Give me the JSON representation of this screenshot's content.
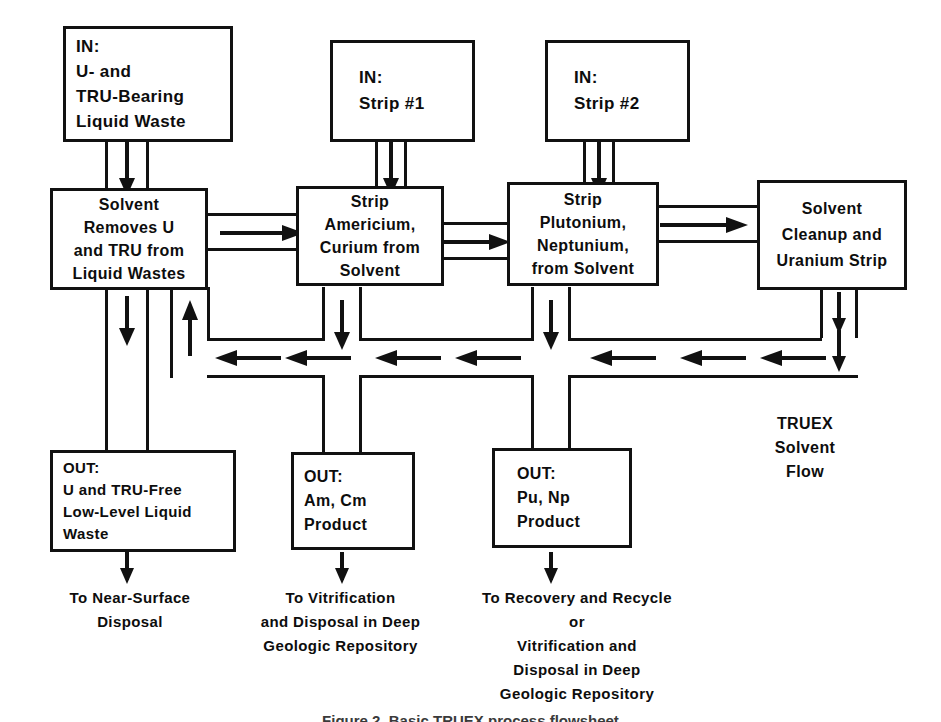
{
  "diagram": {
    "title": "TRUEX Process Flowsheet",
    "ink_color": "#111111",
    "background_color": "#ffffff"
  },
  "inputs": [
    {
      "id": "in-liquid-waste",
      "lines": [
        "IN:",
        "U- and",
        "TRU-Bearing",
        "Liquid Waste"
      ]
    },
    {
      "id": "in-strip-1",
      "lines": [
        "IN:",
        "Strip #1"
      ]
    },
    {
      "id": "in-strip-2",
      "lines": [
        "IN:",
        "Strip #2"
      ]
    }
  ],
  "processes": [
    {
      "id": "solvent-extraction",
      "lines": [
        "Solvent",
        "Removes U",
        "and TRU from",
        "Liquid Wastes"
      ]
    },
    {
      "id": "strip-am-cm",
      "lines": [
        "Strip",
        "Americium,",
        "Curium from",
        "Solvent"
      ]
    },
    {
      "id": "strip-pu-np",
      "lines": [
        "Strip",
        "Plutonium,",
        "Neptunium,",
        "from Solvent"
      ]
    },
    {
      "id": "solvent-cleanup",
      "lines": [
        "Solvent",
        "Cleanup and",
        "Uranium Strip"
      ]
    }
  ],
  "outputs": [
    {
      "id": "out-low-level-waste",
      "lines": [
        "OUT:",
        "U and TRU-Free",
        "Low-Level Liquid",
        "Waste"
      ]
    },
    {
      "id": "out-am-cm",
      "lines": [
        "OUT:",
        "Am, Cm",
        "Product"
      ]
    },
    {
      "id": "out-pu-np",
      "lines": [
        "OUT:",
        "Pu, Np",
        "Product"
      ]
    }
  ],
  "destinations": [
    {
      "id": "dest-near-surface",
      "lines": [
        "To  Near-Surface",
        "Disposal"
      ]
    },
    {
      "id": "dest-vitrification",
      "lines": [
        "To Vitrification",
        "and Disposal in Deep",
        "Geologic Repository"
      ]
    },
    {
      "id": "dest-recovery-recycle",
      "lines": [
        "To Recovery and Recycle",
        "or",
        "Vitrification and",
        "Disposal in Deep",
        "Geologic Repository"
      ]
    }
  ],
  "annotations": {
    "solvent_flow_label": [
      "TRUEX",
      "Solvent",
      "Flow"
    ]
  },
  "figure_caption": "Figure  2.   Basic  TRUEX  process  flowsheet"
}
